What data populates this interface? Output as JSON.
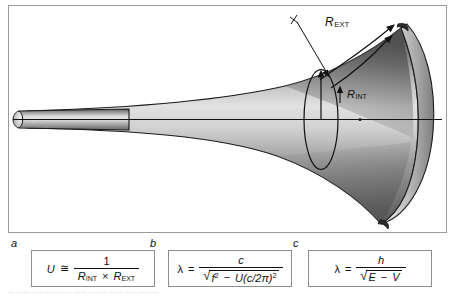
{
  "figure": {
    "panel_border_color": "#9a9a9a",
    "background": "#ffffff",
    "labels": {
      "r_ext": {
        "base": "R",
        "sub": "EXT"
      },
      "r_int": {
        "base": "R",
        "sub": "INT"
      }
    },
    "annotations": {
      "crosshair": "+",
      "axis_line": "horizontal-center-axis",
      "cross_section": "ellipse-ring",
      "curved_arrow": "bell-edge-arrow",
      "leader_line": "r-ext-leader",
      "radius_arrow": "r-int-arrow"
    },
    "shape": "flared-horn-bell"
  },
  "formulas": [
    {
      "letter": "a",
      "lhs": "U",
      "relation": "≅",
      "numerator": "1",
      "denominator_parts": [
        {
          "base": "R",
          "sub": "INT"
        },
        {
          "op": "×"
        },
        {
          "base": "R",
          "sub": "EXT"
        }
      ],
      "plain": "U ≅ 1 / (R_INT × R_EXT)"
    },
    {
      "letter": "b",
      "lhs": "λ",
      "relation": "=",
      "numerator": "c",
      "denominator_radical": {
        "term1": "f",
        "term1_sup": "2",
        "minus": "−",
        "term2": "U",
        "term2_paren": "(c/2π)",
        "term2_sup": "2"
      },
      "plain": "λ = c / √(f² − U(c/2π)²)"
    },
    {
      "letter": "c",
      "lhs": "λ",
      "relation": "=",
      "numerator": "h",
      "denominator_radical": {
        "term1": "E",
        "minus": "−",
        "term2": "V"
      },
      "plain": "λ = h / √(E − V)"
    }
  ],
  "caption": "— —— —— ———— —— ——— —— —— ———"
}
